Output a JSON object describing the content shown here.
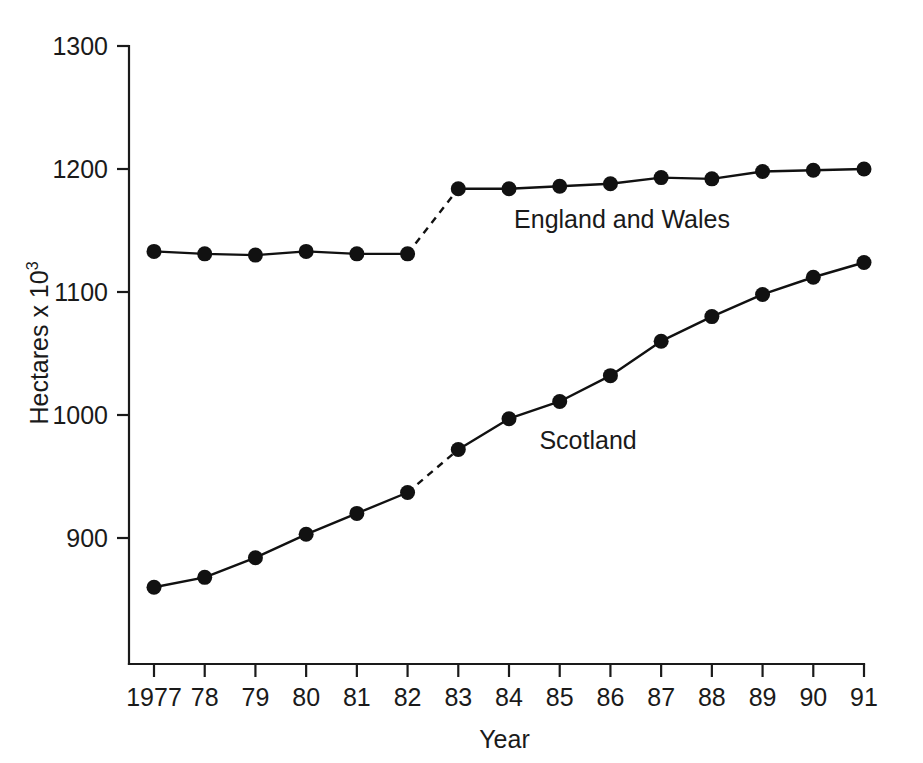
{
  "chart_data": {
    "type": "line",
    "title": "",
    "xlabel": "Year",
    "ylabel": "Hectares x 10",
    "ylabel_exponent": "3",
    "grid": false,
    "legend_position": "inline-annotation",
    "x": [
      1977,
      1978,
      1979,
      1980,
      1981,
      1982,
      1983,
      1984,
      1985,
      1986,
      1987,
      1988,
      1989,
      1990,
      1991
    ],
    "categories": [
      "1977",
      "78",
      "79",
      "80",
      "81",
      "82",
      "83",
      "84",
      "85",
      "86",
      "87",
      "88",
      "89",
      "90",
      "91"
    ],
    "xlim": [
      1977,
      1991
    ],
    "ylim": [
      820,
      1300
    ],
    "yticks": [
      900,
      1000,
      1100,
      1200,
      1300
    ],
    "ytick_labels": [
      "900",
      "1000",
      "1100",
      "1200",
      "1300"
    ],
    "series": [
      {
        "name": "England and Wales",
        "label_x": 1984.1,
        "label_y": 1152,
        "break_after_index": 5,
        "values": [
          1133,
          1131,
          1130,
          1133,
          1131,
          1131,
          1184,
          1184,
          1186,
          1188,
          1193,
          1192,
          1198,
          1199,
          1200
        ]
      },
      {
        "name": "Scotland",
        "label_x": 1984.6,
        "label_y": 972,
        "break_after_index": 5,
        "values": [
          860,
          868,
          884,
          903,
          920,
          937,
          972,
          997,
          1011,
          1032,
          1060,
          1080,
          1098,
          1112,
          1124
        ]
      }
    ]
  },
  "annotations": {
    "england_and_wales_label": "England and Wales",
    "scotland_label": "Scotland"
  }
}
